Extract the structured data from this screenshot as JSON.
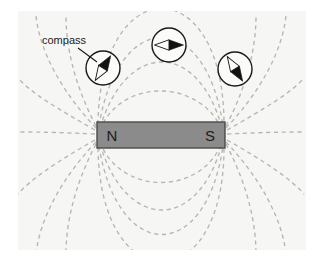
{
  "figure": {
    "background_color": "#f6f6f5",
    "page_color": "#ffffff"
  },
  "magnet": {
    "north_label": "N",
    "south_label": "S",
    "fill_color": "#8b8b8b",
    "border_color": "#4a4a4a",
    "x": 97,
    "y": 122,
    "width": 128,
    "height": 26
  },
  "callout": {
    "label": "compass",
    "text_x": 42,
    "text_y": 44,
    "leader_from_x": 78,
    "leader_from_y": 48,
    "leader_to_x": 97,
    "leader_to_y": 62
  },
  "compasses": [
    {
      "name": "compass-left",
      "cx": 103,
      "cy": 68,
      "r": 17,
      "needle_angle_deg": -58,
      "dark_color": "#121212",
      "light_color": "#fbfbfa"
    },
    {
      "name": "compass-top",
      "cx": 169,
      "cy": 45,
      "r": 17,
      "needle_angle_deg": 0,
      "dark_color": "#121212",
      "light_color": "#fbfbfa"
    },
    {
      "name": "compass-right",
      "cx": 235,
      "cy": 69,
      "r": 17,
      "needle_angle_deg": 58,
      "dark_color": "#121212",
      "light_color": "#fbfbfa"
    }
  ],
  "field_lines": {
    "stroke_color": "#b6b6b2",
    "dash_pattern": "4.2 3.6",
    "stroke_width": 1.35,
    "count": 16,
    "description": "dashed dipole field lines looping from N pole on the left to S pole on the right, above and below the bar magnet",
    "paths": [
      "M 100 130 C 120 78, 200 78, 222 130",
      "M 100 128 C 126 40, 198 40, 222 128",
      "M 99 126 C 118 8, 206 8, 223 126",
      "M 98 124 C 100 -30, 224 -30, 224 124",
      "M 100 142 C 120 196, 202 196, 222 142",
      "M 100 144 C 126 232, 198 232, 222 144",
      "M 99 146 C 118 264, 206 264, 223 146",
      "M 98 148 C 100 300, 224 300, 224 148",
      "M 96 128 C 62 92, 40 52, 36 16",
      "M 95 130 C 56 108, 30 92, 18 78",
      "M 95 134 C 50 132, 32 132, 18 132",
      "M 96 142 C 62 178, 40 218, 36 254",
      "M 95 140 C 56 162, 30 180, 18 194",
      "M 96 126 C 72 80, 66 42, 66 16",
      "M 96 144 C 72 190, 66 228, 66 254",
      "M 226 128 C 260 92, 282 52, 286 16",
      "M 227 130 C 266 108, 292 92, 304 78",
      "M 227 134 C 272 132, 290 132, 304 132",
      "M 226 142 C 260 178, 282 218, 286 254",
      "M 227 140 C 266 162, 292 180, 304 194",
      "M 226 126 C 250 80, 256 42, 256 16",
      "M 226 144 C 250 190, 256 228, 256 254"
    ]
  }
}
